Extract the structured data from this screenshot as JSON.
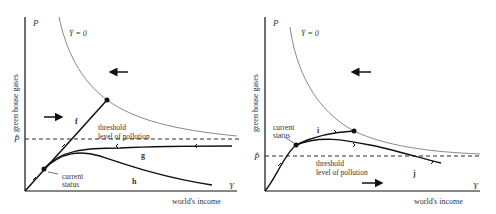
{
  "left_panel": {
    "y_axis_symbol": "P",
    "x_axis_symbol": "Y",
    "y_axis_label": "green house gases",
    "x_axis_label": "world's income",
    "isocline_label": "Ẏ = 0",
    "threshold_symbol": "P̂",
    "threshold_label_line1": "threshold",
    "threshold_label_line2": "level of pollution",
    "current_status_line1": "current",
    "current_status_line2": "status",
    "path_labels": [
      "f",
      "g",
      "h"
    ]
  },
  "right_panel": {
    "y_axis_symbol": "P",
    "x_axis_symbol": "Y",
    "y_axis_label": "green house gases",
    "x_axis_label": "world's income",
    "isocline_label": "Ẏ = 0",
    "threshold_symbol": "P̂",
    "threshold_label_line1": "threshold",
    "threshold_label_line2": "level of pollution",
    "current_status_line1": "current",
    "current_status_line2": "status",
    "path_labels": [
      "i",
      "j"
    ]
  },
  "colors": {
    "axis": "#111111",
    "isocline": "#8a8a8a",
    "path": "#111111",
    "text": "#333333"
  }
}
